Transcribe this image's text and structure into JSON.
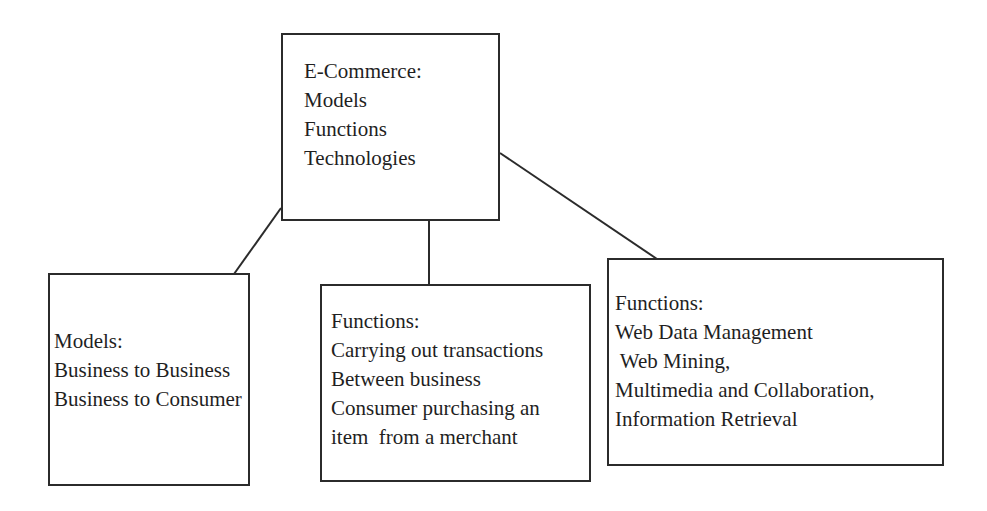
{
  "diagram": {
    "root": {
      "title": "E-Commerce:",
      "lines": [
        "Models",
        "Functions",
        "Technologies"
      ]
    },
    "children": [
      {
        "title": "Models:",
        "lines": [
          "Business to Business",
          "Business to Consumer"
        ]
      },
      {
        "title": "Functions:",
        "lines": [
          "Carrying out transactions",
          "Between business",
          "Consumer purchasing an",
          "item  from a merchant"
        ]
      },
      {
        "title": "Functions:",
        "lines": [
          "Web Data Management",
          " Web Mining,",
          "Multimedia and Collaboration,",
          "Information Retrieval"
        ]
      }
    ],
    "colors": {
      "stroke": "#2b2b2b",
      "text": "#1f1f1f",
      "background": "#ffffff"
    }
  }
}
